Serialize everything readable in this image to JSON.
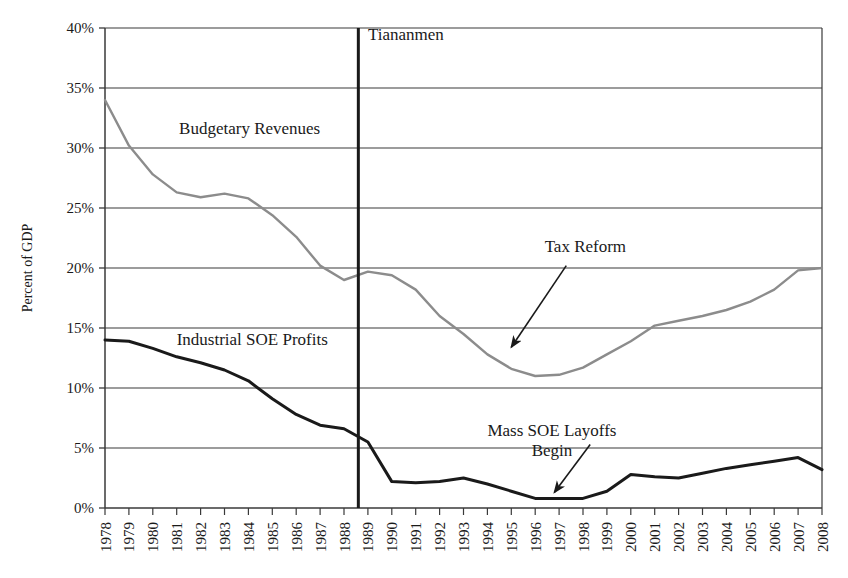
{
  "chart_data": {
    "type": "line",
    "title": "",
    "xlabel": "",
    "ylabel": "Percent of GDP",
    "xlim": [
      1978,
      2008
    ],
    "ylim": [
      0,
      40
    ],
    "yticks": [
      0,
      5,
      10,
      15,
      20,
      25,
      30,
      35,
      40
    ],
    "ytick_labels": [
      "0%",
      "5%",
      "10%",
      "15%",
      "20%",
      "25%",
      "30%",
      "35%",
      "40%"
    ],
    "grid": "horizontal",
    "legend_position": "inline-labels",
    "x": [
      1978,
      1979,
      1980,
      1981,
      1982,
      1983,
      1984,
      1985,
      1986,
      1987,
      1988,
      1989,
      1990,
      1991,
      1992,
      1993,
      1994,
      1995,
      1996,
      1997,
      1998,
      1999,
      2000,
      2001,
      2002,
      2003,
      2004,
      2005,
      2006,
      2007,
      2008
    ],
    "xtick_labels": [
      "1978",
      "1979",
      "1980",
      "1981",
      "1982",
      "1983",
      "1984",
      "1985",
      "1986",
      "1987",
      "1988",
      "1989",
      "1990",
      "1991",
      "1992",
      "1993",
      "1994",
      "1995",
      "1996",
      "1997",
      "1998",
      "1999",
      "2000",
      "2001",
      "2002",
      "2003",
      "2004",
      "2005",
      "2006",
      "2007",
      "2008"
    ],
    "series": [
      {
        "name": "Budgetary Revenues",
        "color": "#8c8c8c",
        "label_x": 1981.1,
        "label_y": 31.2,
        "values": [
          34.0,
          30.2,
          27.8,
          26.3,
          25.9,
          26.2,
          25.8,
          24.4,
          22.6,
          20.2,
          19.0,
          19.7,
          19.4,
          18.2,
          16.0,
          14.5,
          12.8,
          11.6,
          11.0,
          11.1,
          11.7,
          12.8,
          13.9,
          15.2,
          15.6,
          16.0,
          16.5,
          17.2,
          18.2,
          19.8,
          20.0
        ]
      },
      {
        "name": "Industrial SOE Profits",
        "color": "#1a1a1a",
        "label_x": 1981.0,
        "label_y": 13.6,
        "values": [
          14.0,
          13.9,
          13.3,
          12.6,
          12.1,
          11.5,
          10.6,
          9.1,
          7.8,
          6.9,
          6.6,
          5.5,
          2.2,
          2.1,
          2.2,
          2.5,
          2.0,
          1.4,
          0.8,
          0.8,
          0.8,
          1.4,
          2.8,
          2.6,
          2.5,
          2.9,
          3.3,
          3.6,
          3.9,
          4.2,
          3.2
        ]
      }
    ],
    "annotations": [
      {
        "name": "tiananmen",
        "text": "Tiananmen",
        "kind": "vline-label",
        "x": 1988.6,
        "text_x": 1989.0,
        "text_y": 39.0
      },
      {
        "name": "tax-reform",
        "text": "Tax Reform",
        "kind": "arrow-label",
        "text_x": 1998.1,
        "text_y": 21.3,
        "arrow_from_x": 1997.3,
        "arrow_from_y": 20.2,
        "arrow_to_x": 1995.0,
        "arrow_to_y": 13.4
      },
      {
        "name": "mass-soe-layoffs",
        "text_line1": "Mass SOE Layoffs",
        "text_line2": "Begin",
        "kind": "arrow-label",
        "text_x": 1996.7,
        "text_y": 6.0,
        "text2_x": 1996.7,
        "text2_y": 4.3,
        "arrow_from_x": 1998.3,
        "arrow_from_y": 5.3,
        "arrow_to_x": 1996.8,
        "arrow_to_y": 1.3
      }
    ]
  }
}
